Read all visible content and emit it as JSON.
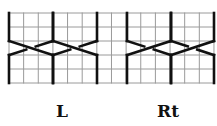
{
  "diagram": {
    "type": "cable-knitting-chart",
    "grid": {
      "columns": 14,
      "rows": 5,
      "x0": 9,
      "y0": 13,
      "cell_w": 14.64,
      "cell_h": 14,
      "line_color": "#9a9a9a",
      "stroke_color": "#111111"
    },
    "cables": [
      {
        "name": "cable-1",
        "direction": "L",
        "x_left": 9,
        "x_right": 53
      },
      {
        "name": "cable-2",
        "direction": "L",
        "x_left": 53,
        "x_right": 97
      },
      {
        "name": "cable-3",
        "direction": "Rt",
        "x_left": 127,
        "x_right": 171
      },
      {
        "name": "cable-4",
        "direction": "Rt",
        "x_left": 171,
        "x_right": 214
      }
    ],
    "cross_top_y": 41,
    "cross_bottom_y": 55
  },
  "labels": {
    "left": "L",
    "right": "Rt"
  }
}
